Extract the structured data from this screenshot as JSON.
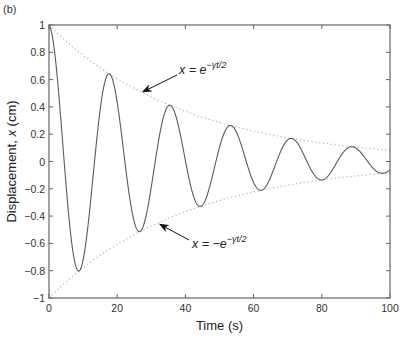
{
  "panel_label": "(b)",
  "chart_data": {
    "type": "line",
    "title": "",
    "xlabel": "Time (s)",
    "ylabel": "Displacement, x (cm)",
    "xlim": [
      0,
      100
    ],
    "ylim": [
      -1,
      1
    ],
    "xticks": [
      0,
      20,
      40,
      60,
      80,
      100
    ],
    "xtick_labels": [
      "0",
      "20",
      "40",
      "60",
      "80",
      "100"
    ],
    "yticks": [
      -1,
      -0.8,
      -0.6,
      -0.4,
      -0.2,
      0,
      0.2,
      0.4,
      0.6,
      0.8,
      1
    ],
    "ytick_labels": [
      "−1",
      "−0.8",
      "−0.6",
      "−0.4",
      "−0.2",
      "0",
      "0.2",
      "0.4",
      "0.6",
      "0.8",
      "1"
    ],
    "grid": false,
    "legend": null,
    "series": [
      {
        "name": "x(t) = e^(−γt/2) cos(ωt)",
        "style": "solid",
        "color": "#5a5a5a",
        "params": {
          "gamma_half": 0.025,
          "omega": 0.353
        },
        "key_points": [
          {
            "t": 0,
            "x": 1.0
          },
          {
            "t": 8.9,
            "x": -0.8
          },
          {
            "t": 17.8,
            "x": 0.64
          },
          {
            "t": 26.7,
            "x": -0.51
          },
          {
            "t": 35.6,
            "x": 0.41
          },
          {
            "t": 44.5,
            "x": -0.33
          },
          {
            "t": 53.4,
            "x": 0.26
          },
          {
            "t": 62.3,
            "x": -0.21
          },
          {
            "t": 71.2,
            "x": 0.17
          },
          {
            "t": 80.1,
            "x": -0.13
          },
          {
            "t": 89.0,
            "x": 0.11
          },
          {
            "t": 97.9,
            "x": -0.09
          },
          {
            "t": 100,
            "x": -0.07
          }
        ]
      },
      {
        "name": "x = e^(−γt/2)",
        "style": "dotted",
        "color": "#bdbdbd",
        "key_points": [
          {
            "t": 0,
            "x": 1.0
          },
          {
            "t": 20,
            "x": 0.61
          },
          {
            "t": 40,
            "x": 0.37
          },
          {
            "t": 60,
            "x": 0.22
          },
          {
            "t": 80,
            "x": 0.14
          },
          {
            "t": 100,
            "x": 0.08
          }
        ]
      },
      {
        "name": "x = −e^(−γt/2)",
        "style": "dotted",
        "color": "#bdbdbd",
        "key_points": [
          {
            "t": 0,
            "x": -1.0
          },
          {
            "t": 20,
            "x": -0.61
          },
          {
            "t": 40,
            "x": -0.37
          },
          {
            "t": 60,
            "x": -0.22
          },
          {
            "t": 80,
            "x": -0.14
          },
          {
            "t": 100,
            "x": -0.08
          }
        ]
      }
    ],
    "annotations": [
      {
        "text_main": "x = e",
        "text_sup": "−γt/2",
        "arrow_to": {
          "t": 27.5,
          "x": 0.51
        }
      },
      {
        "text_main": "x = −e",
        "text_sup": "−γt/2",
        "arrow_to": {
          "t": 32.5,
          "x": -0.46
        }
      }
    ]
  }
}
